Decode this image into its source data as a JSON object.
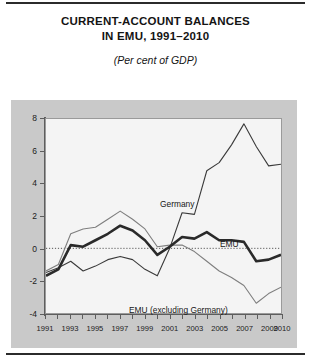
{
  "header": {
    "title_line1": "CURRENT-ACCOUNT BALANCES",
    "title_line2": "IN EMU, 1991–2010",
    "subtitle": "(Per cent of GDP)"
  },
  "chart_data": {
    "type": "line",
    "title": "CURRENT-ACCOUNT BALANCES IN EMU, 1991–2010",
    "subtitle": "(Per cent of GDP)",
    "xlabel": "",
    "ylabel": "",
    "ylim": [
      -4,
      8
    ],
    "yticks": [
      8,
      6,
      4,
      2,
      0,
      -2,
      -4
    ],
    "xlim": [
      1991,
      2010
    ],
    "x": [
      1991,
      1992,
      1993,
      1994,
      1995,
      1996,
      1997,
      1998,
      1999,
      2000,
      2001,
      2002,
      2003,
      2004,
      2005,
      2006,
      2007,
      2008,
      2009,
      2010
    ],
    "xtick_labels": [
      "1991",
      "1993",
      "1995",
      "1997",
      "1999",
      "2001",
      "2003",
      "2005",
      "2007",
      "2009",
      "2010"
    ],
    "xtick_values": [
      1991,
      1993,
      1995,
      1997,
      1999,
      2001,
      2003,
      2005,
      2007,
      2009,
      2010
    ],
    "grid": false,
    "zero_line": true,
    "legend": "inline-annotations",
    "series": [
      {
        "name": "Germany",
        "style": "thin-dark",
        "color": "#3a3a3a",
        "values": [
          -1.5,
          -1.2,
          -0.8,
          -1.4,
          -1.1,
          -0.7,
          -0.5,
          -0.7,
          -1.3,
          -1.7,
          0.0,
          2.2,
          2.1,
          4.8,
          5.3,
          6.4,
          7.7,
          6.3,
          5.1,
          5.2
        ]
      },
      {
        "name": "EMU",
        "style": "thick-dark",
        "color": "#2a2a2a",
        "values": [
          -1.7,
          -1.3,
          0.2,
          0.1,
          0.5,
          0.9,
          1.4,
          1.1,
          0.5,
          -0.4,
          0.1,
          0.7,
          0.6,
          1.0,
          0.5,
          0.5,
          0.4,
          -0.8,
          -0.7,
          -0.4
        ]
      },
      {
        "name": "EMU (excluding Germany)",
        "style": "thin-gray",
        "color": "#7e7e7e",
        "values": [
          -1.4,
          -1.0,
          0.9,
          1.2,
          1.3,
          1.8,
          2.3,
          1.8,
          1.2,
          0.1,
          0.2,
          0.2,
          -0.2,
          -0.8,
          -1.4,
          -1.8,
          -2.3,
          -3.4,
          -2.8,
          -2.4
        ]
      }
    ],
    "annotations": [
      {
        "text": "Germany",
        "series": "Germany"
      },
      {
        "text": "EMU",
        "series": "EMU"
      },
      {
        "text": "EMU (excluding Germany)",
        "series": "EMU (excluding Germany)"
      }
    ]
  }
}
